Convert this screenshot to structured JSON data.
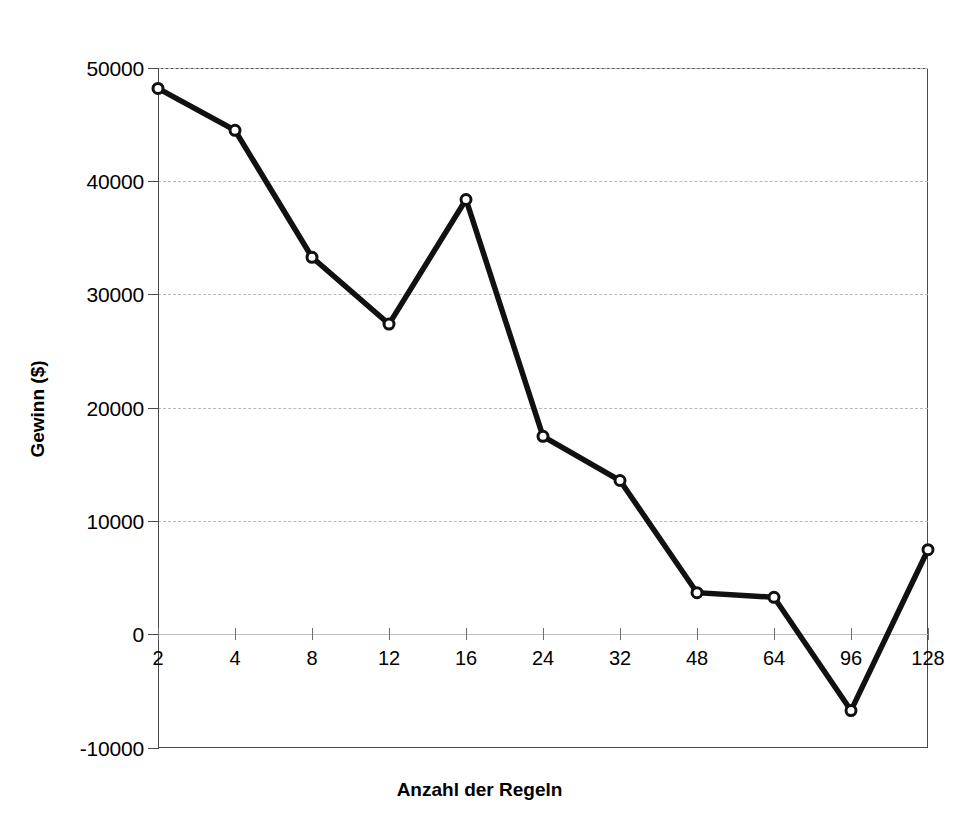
{
  "chart_data": {
    "type": "line",
    "title": "",
    "xlabel": "Anzahl der Regeln",
    "ylabel": "Gewinn ($)",
    "categories": [
      "2",
      "4",
      "8",
      "12",
      "16",
      "24",
      "32",
      "48",
      "64",
      "96",
      "128"
    ],
    "values": [
      48200,
      44500,
      33300,
      27400,
      38400,
      17500,
      13600,
      3700,
      3300,
      -6700,
      7500
    ],
    "x_tick_labels": [
      "2",
      "4",
      "8",
      "12",
      "16",
      "24",
      "32",
      "48",
      "64",
      "96",
      "128"
    ],
    "y_tick_labels": [
      "50000",
      "40000",
      "30000",
      "20000",
      "10000",
      "0",
      "-10000"
    ],
    "y_tick_values": [
      50000,
      40000,
      30000,
      20000,
      10000,
      0,
      -10000
    ],
    "ylim": [
      -10000,
      50000
    ],
    "grid": true,
    "grid_axis": "y",
    "legend": false,
    "legend_position": "none",
    "marker": "open-circle",
    "line_color": "#111111",
    "grid_color": "#b9b9b9",
    "frame_color": "#4a4a4a",
    "background": "#ffffff"
  },
  "axis": {
    "y_title": "Gewinn ($)",
    "x_title": "Anzahl der Regeln"
  }
}
